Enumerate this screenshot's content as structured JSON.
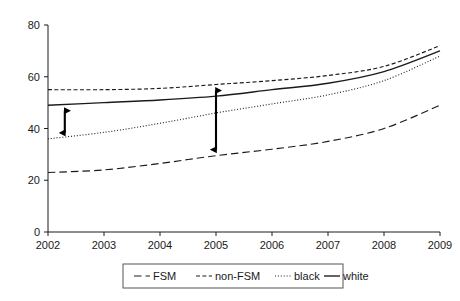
{
  "chart_data": {
    "type": "line",
    "title": "",
    "xlabel": "",
    "ylabel": "",
    "x": [
      2002,
      2003,
      2004,
      2005,
      2006,
      2007,
      2008,
      2009
    ],
    "xlim": [
      2002,
      2009
    ],
    "ylim": [
      0,
      80
    ],
    "yticks": [
      0,
      20,
      40,
      60,
      80
    ],
    "xticks": [
      2002,
      2003,
      2004,
      2005,
      2006,
      2007,
      2008,
      2009
    ],
    "grid": false,
    "legend_position": "bottom",
    "series": [
      {
        "name": "FSM",
        "style": "long-dashed",
        "values": [
          23,
          24,
          26.5,
          29.5,
          32,
          35,
          40,
          49
        ]
      },
      {
        "name": "non-FSM",
        "style": "short-dashed",
        "values": [
          55,
          55,
          55.5,
          57,
          58.5,
          60.5,
          64,
          72
        ]
      },
      {
        "name": "black",
        "style": "dotted",
        "values": [
          36,
          38.5,
          42,
          46,
          49.5,
          53,
          58.5,
          68
        ]
      },
      {
        "name": "white",
        "style": "solid",
        "values": [
          49,
          50,
          51,
          52.5,
          55,
          57.5,
          62,
          70
        ]
      }
    ],
    "annotations": [
      {
        "name": "gap-arrow-2002",
        "x": 2002.3,
        "y_top": 49.2,
        "y_bottom": 36.0,
        "kind": "double-headed-arrow"
      },
      {
        "name": "gap-arrow-2005",
        "x": 2005.0,
        "y_top": 57.0,
        "y_bottom": 29.5,
        "kind": "double-headed-arrow"
      }
    ]
  },
  "axis": {
    "y_tick_labels": [
      "0",
      "20",
      "40",
      "60",
      "80"
    ],
    "x_tick_labels": [
      "2002",
      "2003",
      "2004",
      "2005",
      "2006",
      "2007",
      "2008",
      "2009"
    ]
  },
  "legend": {
    "entries": [
      {
        "label": "FSM",
        "swatch": "long-dashed-swatch"
      },
      {
        "label": "non-FSM",
        "swatch": "short-dashed-swatch"
      },
      {
        "label": "black",
        "swatch": "dotted-swatch"
      },
      {
        "label": "white",
        "swatch": "solid-swatch"
      }
    ]
  },
  "colors": {
    "ink": "#1a1a1a",
    "line": "#000000",
    "frame": "#555555",
    "background": "#ffffff"
  }
}
